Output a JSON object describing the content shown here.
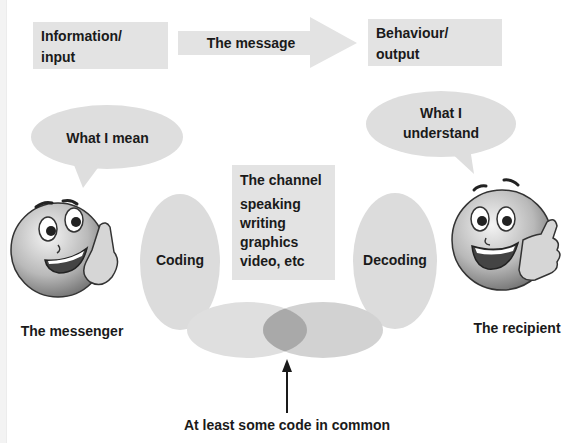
{
  "diagram": {
    "top_row": {
      "input_box": {
        "line1": "Information/",
        "line2": "input"
      },
      "message_arrow": {
        "label": "The message"
      },
      "output_box": {
        "line1": "Behaviour/",
        "line2": "output"
      }
    },
    "messenger": {
      "bubble": "What I mean",
      "coding_label": "Coding",
      "caption": "The messenger",
      "icon": "smiley-whispering-icon"
    },
    "channel": {
      "title": "The channel",
      "items": [
        "speaking",
        "writing",
        "graphics",
        "video, etc"
      ]
    },
    "recipient": {
      "bubble_line1": "What I",
      "bubble_line2": "understand",
      "decoding_label": "Decoding",
      "caption": "The recipient",
      "icon": "smiley-thumbs-up-icon"
    },
    "overlap": {
      "caption": "At least some code in common",
      "pointer": "up-arrow-icon"
    },
    "colors": {
      "box_fill": "#e3e3e3",
      "ellipse_fill": "#dcdcdc",
      "overlap_fill": "#a9a9a9",
      "text": "#1a1a1a"
    }
  }
}
